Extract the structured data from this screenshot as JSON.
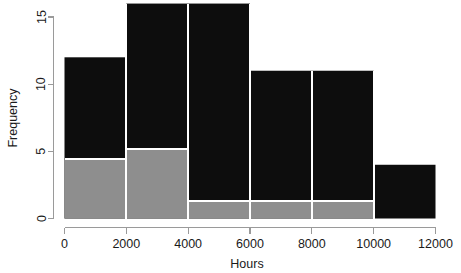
{
  "chart_data": {
    "type": "bar",
    "title": "",
    "subtitle": "",
    "xlabel": "Hours",
    "ylabel": "Frequency",
    "xlim": [
      0,
      12000
    ],
    "ylim": [
      0,
      16
    ],
    "grid": false,
    "legend_position": "none",
    "bin_width": 2000,
    "bin_edges": [
      0,
      2000,
      4000,
      6000,
      8000,
      10000,
      12000
    ],
    "categories": [
      "0-2000",
      "2000-4000",
      "4000-6000",
      "6000-8000",
      "8000-10000",
      "10000-12000"
    ],
    "xticks": [
      0,
      2000,
      4000,
      6000,
      8000,
      10000,
      12000
    ],
    "xtick_labels": [
      "0",
      "2000",
      "4000",
      "6000",
      "8000",
      "10000",
      "12000"
    ],
    "yticks": [
      0,
      5,
      10,
      15
    ],
    "ytick_labels": [
      "0",
      "5",
      "10",
      "15"
    ],
    "series": [
      {
        "name": "total",
        "color": "#0d0d0d",
        "values": [
          12,
          16,
          16,
          11,
          11,
          4
        ]
      },
      {
        "name": "subgroup",
        "color": "#8e8e8e",
        "values": [
          4.4,
          5.2,
          1.3,
          1.3,
          1.3,
          0
        ]
      }
    ],
    "annotations": []
  },
  "colors": {
    "background": "#ffffff",
    "bar_total": "#0d0d0d",
    "bar_subgroup": "#8e8e8e",
    "axis": "#9a9a9a",
    "text": "#1a1a1a",
    "separator": "#ffffff"
  }
}
